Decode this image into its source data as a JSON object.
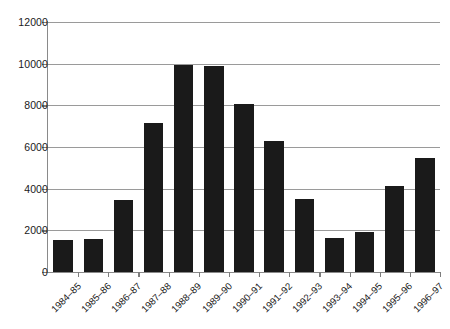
{
  "chart_data": {
    "type": "bar",
    "title": "",
    "subtitle": "",
    "xlabel": "",
    "ylabel": "",
    "categories": [
      "1984–85",
      "1985–86",
      "1986–87",
      "1987–88",
      "1988–89",
      "1989–90",
      "1990–91",
      "1991–92",
      "1992–93",
      "1993–94",
      "1994–95",
      "1995–96",
      "1996–97"
    ],
    "values": [
      1550,
      1600,
      3450,
      7150,
      9950,
      9900,
      8050,
      6300,
      3500,
      1650,
      1900,
      4150,
      5450
    ],
    "ylim": [
      0,
      12000
    ],
    "ytick_values": [
      0,
      2000,
      4000,
      6000,
      8000,
      10000,
      12000
    ],
    "ytick_labels": [
      "0",
      "2000",
      "4000",
      "6000",
      "8000",
      "10000",
      "12000"
    ],
    "grid": true,
    "grid_axis": "y",
    "legend": false,
    "legend_position": "none",
    "bar_color": "#1a1a1a",
    "grid_color": "#9a9a9a",
    "axis_color": "#8a8a8a",
    "background_color": "#ffffff",
    "xtick_label_rotation": -45
  }
}
